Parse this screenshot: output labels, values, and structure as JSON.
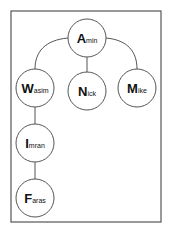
{
  "diagram": {
    "type": "tree",
    "root": "Amin",
    "nodes": [
      {
        "id": "amin",
        "label": "Amin",
        "initial": "A",
        "rest": "min",
        "parent": null
      },
      {
        "id": "wasim",
        "label": "Wasim",
        "initial": "W",
        "rest": "asim",
        "parent": "amin"
      },
      {
        "id": "nick",
        "label": "Nick",
        "initial": "N",
        "rest": "ick",
        "parent": "amin"
      },
      {
        "id": "mike",
        "label": "Mike",
        "initial": "M",
        "rest": "ike",
        "parent": "amin"
      },
      {
        "id": "imran",
        "label": "Imran",
        "initial": "I",
        "rest": "mran",
        "parent": "wasim"
      },
      {
        "id": "faras",
        "label": "Faras",
        "initial": "F",
        "rest": "aras",
        "parent": "imran"
      }
    ],
    "colors": {
      "stroke": "#555555",
      "text": "#111111",
      "background": "#ffffff"
    }
  }
}
